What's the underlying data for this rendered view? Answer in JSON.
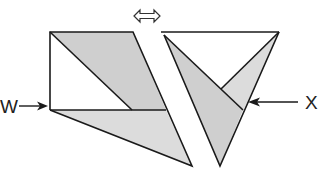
{
  "diagram": {
    "labels": {
      "w": "W",
      "x": "X"
    },
    "colors": {
      "stroke": "#1a1a1a",
      "shade_dark": "#cfcfcf",
      "shade_light": "#dcdcdc",
      "background": "#ffffff"
    },
    "icons": {
      "swap": "double-headed-hollow-arrow"
    },
    "figures": [
      {
        "name": "left-figure",
        "description": "Rectangle with shaded parallelogram and shaded triangle below line W"
      },
      {
        "name": "right-figure",
        "description": "Inverted triangle with inner shaded triangles, X points to inner vertex"
      }
    ]
  }
}
